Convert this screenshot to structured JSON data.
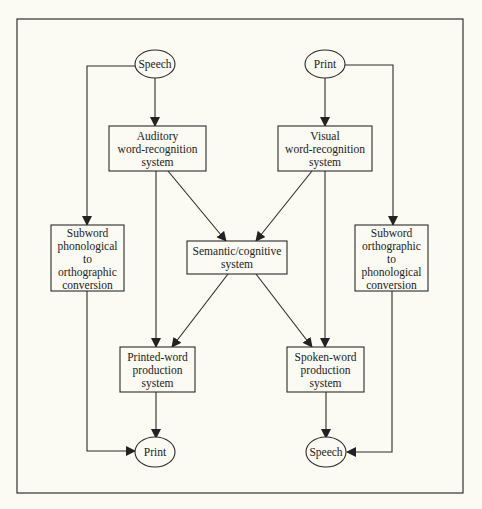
{
  "diagram": {
    "type": "flowchart",
    "nodes": {
      "speech_in": {
        "label": "Speech",
        "shape": "ellipse"
      },
      "print_in": {
        "label": "Print",
        "shape": "ellipse"
      },
      "auditory": {
        "lines": [
          "Auditory",
          "word-recognition",
          "system"
        ]
      },
      "visual": {
        "lines": [
          "Visual",
          "word-recognition",
          "system"
        ]
      },
      "subword_left": {
        "lines": [
          "Subword",
          "phonological",
          "to",
          "orthographic",
          "conversion"
        ]
      },
      "semantic": {
        "lines": [
          "Semantic/cognitive",
          "system"
        ]
      },
      "subword_right": {
        "lines": [
          "Subword",
          "orthographic",
          "to",
          "phonological",
          "conversion"
        ]
      },
      "printed_word": {
        "lines": [
          "Printed-word",
          "production",
          "system"
        ]
      },
      "spoken_word": {
        "lines": [
          "Spoken-word",
          "production",
          "system"
        ]
      },
      "print_out": {
        "label": "Print",
        "shape": "ellipse"
      },
      "speech_out": {
        "label": "Speech",
        "shape": "ellipse"
      }
    },
    "edges": [
      [
        "Speech",
        "Auditory word-recognition system"
      ],
      [
        "Speech",
        "Subword phonological to orthographic conversion"
      ],
      [
        "Print",
        "Visual word-recognition system"
      ],
      [
        "Print",
        "Subword orthographic to phonological conversion"
      ],
      [
        "Auditory word-recognition system",
        "Semantic/cognitive system"
      ],
      [
        "Auditory word-recognition system",
        "Printed-word production system"
      ],
      [
        "Visual word-recognition system",
        "Semantic/cognitive system"
      ],
      [
        "Visual word-recognition system",
        "Spoken-word production system"
      ],
      [
        "Semantic/cognitive system",
        "Printed-word production system"
      ],
      [
        "Semantic/cognitive system",
        "Spoken-word production system"
      ],
      [
        "Subword phonological to orthographic conversion",
        "Print"
      ],
      [
        "Subword orthographic to phonological conversion",
        "Speech"
      ],
      [
        "Printed-word production system",
        "Print"
      ],
      [
        "Spoken-word production system",
        "Speech"
      ]
    ],
    "colors": {
      "background": "#fbfaf3",
      "stroke": "#2a2a2a",
      "text": "#222222"
    }
  }
}
